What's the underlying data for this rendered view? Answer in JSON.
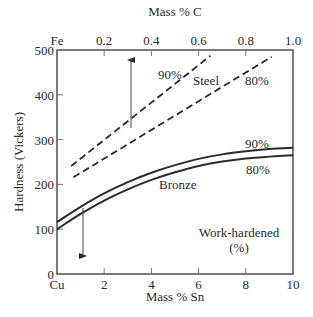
{
  "chart_data": {
    "type": "line",
    "title": "",
    "xlabel_bottom": "Mass % Sn",
    "xlabel_top": "Mass % C",
    "ylabel": "Hardness (Vickers)",
    "x_bottom": {
      "range": [
        0,
        10
      ],
      "ticks": [
        0,
        2,
        4,
        6,
        8,
        10
      ],
      "tick_labels": [
        "Cu",
        "2",
        "4",
        "6",
        "8",
        "10"
      ]
    },
    "x_top": {
      "range": [
        0,
        1.0
      ],
      "ticks": [
        0,
        0.2,
        0.4,
        0.6,
        0.8,
        1.0
      ],
      "tick_labels": [
        "Fe",
        "0.2",
        "0.4",
        "0.6",
        "0.8",
        "1.0"
      ]
    },
    "y": {
      "range": [
        0,
        500
      ],
      "ticks": [
        0,
        100,
        200,
        300,
        400,
        500
      ],
      "tick_labels": [
        "0",
        "100",
        "200",
        "300",
        "400",
        "500"
      ]
    },
    "grid": false,
    "series": [
      {
        "name": "Steel 90% work-hardened",
        "axis": "top",
        "style": "dashed",
        "x": [
          0.06,
          0.65
        ],
        "y": [
          241,
          487
        ]
      },
      {
        "name": "Steel 80% work-hardened",
        "axis": "top",
        "style": "dashed",
        "x": [
          0.07,
          0.91
        ],
        "y": [
          216,
          485
        ]
      },
      {
        "name": "Bronze 90% work-hardened",
        "axis": "bottom",
        "style": "solid",
        "x": [
          0,
          1,
          2,
          3,
          4,
          5,
          6,
          7,
          8,
          9,
          10
        ],
        "y": [
          116,
          150,
          180,
          205,
          226,
          243,
          257,
          267,
          274,
          279,
          282
        ]
      },
      {
        "name": "Bronze 80% work-hardened",
        "axis": "bottom",
        "style": "solid",
        "x": [
          0,
          1,
          2,
          3,
          4,
          5,
          6,
          7,
          8,
          9,
          10
        ],
        "y": [
          100,
          134,
          164,
          189,
          210,
          227,
          241,
          251,
          258,
          262,
          265
        ]
      }
    ],
    "annotations": [
      {
        "text": "90%",
        "near": "Steel 90% line"
      },
      {
        "text": "Steel",
        "near": "between steel lines"
      },
      {
        "text": "80%",
        "near": "Steel 80% line"
      },
      {
        "text": "90%",
        "near": "Bronze 90% line"
      },
      {
        "text": "80%",
        "near": "Bronze 80% line"
      },
      {
        "text": "Bronze",
        "near": "bronze curves"
      },
      {
        "text": "Work-hardened",
        "near": "lower right"
      },
      {
        "text": "(%)",
        "near": "lower right"
      },
      {
        "arrow": "up",
        "x_top": 0.31,
        "from_y": 326,
        "to_y": 482
      },
      {
        "arrow": "down",
        "x_bottom": 1.1,
        "from_y": 147,
        "to_y": 36
      }
    ]
  },
  "labels": {
    "top_axis_title": "Mass % C",
    "bottom_axis_title": "Mass % Sn",
    "y_axis_title": "Hardness (Vickers)",
    "steel": "Steel",
    "bronze": "Bronze",
    "steel_90": "90%",
    "steel_80": "80%",
    "bronze_90": "90%",
    "bronze_80": "80%",
    "legend_line1": "Work-hardened",
    "legend_line2": "(%)"
  }
}
